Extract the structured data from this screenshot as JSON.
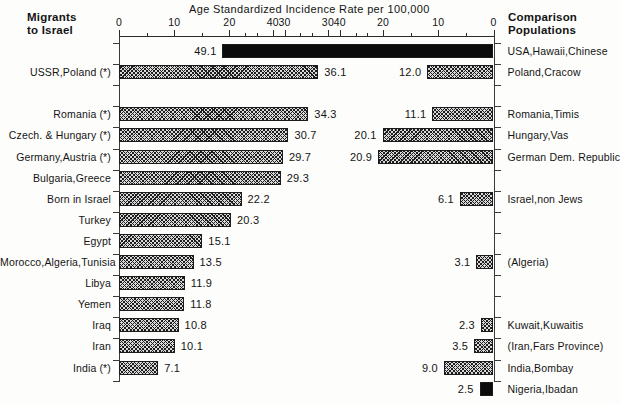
{
  "title": "Age Standardized Incidence Rate per 100,000",
  "headers": {
    "left_line1": "Migrants",
    "left_line2": "to Israel",
    "right_line1": "Comparison",
    "right_line2": "Populations"
  },
  "axes": {
    "left": {
      "ticks": [
        0,
        10,
        20,
        30,
        40
      ],
      "min": 0,
      "max": 50,
      "direction": "right"
    },
    "right": {
      "ticks": [
        40,
        30,
        20,
        10,
        0
      ],
      "min": 0,
      "max": 50,
      "direction": "left"
    }
  },
  "chart_data": {
    "type": "bar",
    "title": "Age Standardized Incidence Rate per 100,000",
    "xlabel": "Age Standardized Incidence Rate per 100,000",
    "ylabel": "",
    "xlim": [
      0,
      50
    ],
    "grid": false,
    "legend": "none",
    "orientation": "horizontal",
    "panels": [
      {
        "name": "Migrants to Israel",
        "direction": "right",
        "categories": [
          "USSR,Poland (*)",
          "Romania (*)",
          "Czech. & Hungary (*)",
          "Germany,Austria (*)",
          "Bulgaria,Greece",
          "Born in Israel",
          "Turkey",
          "Egypt",
          "Morocco,Algeria,Tunisia",
          "Libya",
          "Yemen",
          "Iraq",
          "Iran",
          "India (*)"
        ],
        "values": [
          36.1,
          34.3,
          30.7,
          29.7,
          29.3,
          22.2,
          20.3,
          15.1,
          13.5,
          11.9,
          11.8,
          10.8,
          10.1,
          7.1
        ],
        "rows": [
          1,
          3,
          4,
          5,
          6,
          7,
          8,
          9,
          10,
          11,
          12,
          13,
          14,
          15
        ],
        "fills": [
          "hatch",
          "hatch",
          "hatch",
          "hatch",
          "hatch",
          "hatch",
          "hatch",
          "hatch",
          "hatch",
          "hatch",
          "hatch",
          "hatch",
          "hatch",
          "hatch"
        ]
      },
      {
        "name": "Comparison Populations",
        "direction": "left",
        "categories": [
          "USA,Hawaii,Chinese",
          "Poland,Cracow",
          "Romania,Timis",
          "Hungary,Vas",
          "German Dem. Republic",
          "Israel,non Jews",
          "(Algeria)",
          "Kuwait,Kuwaitis",
          "(Iran,Fars Province)",
          "India,Bombay",
          "Nigeria,Ibadan"
        ],
        "values": [
          49.1,
          12.0,
          11.1,
          20.1,
          20.9,
          6.1,
          3.1,
          2.3,
          3.5,
          9.0,
          2.5
        ],
        "rows": [
          0,
          1,
          3,
          4,
          5,
          7,
          10,
          13,
          14,
          15,
          16
        ],
        "fills": [
          "solid",
          "hatch",
          "hatch",
          "hatch",
          "hatch",
          "hatch",
          "hatch",
          "hatch",
          "hatch",
          "hatch",
          "solid"
        ]
      }
    ]
  },
  "colors": {
    "bar_hatch_fill": "#d9d9d9",
    "bar_hatch_line": "#1d1d1d",
    "bar_solid": "#0c0c0c",
    "axis": "#2b2b2b",
    "text": "#141414",
    "background": "#fdfdfb"
  }
}
